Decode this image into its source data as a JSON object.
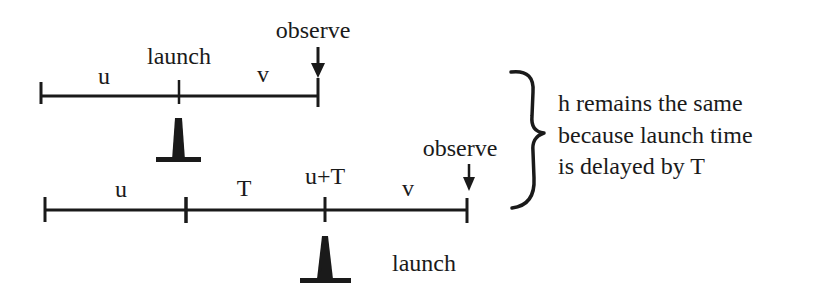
{
  "diagram": {
    "scenario_1": {
      "labels": {
        "segment_before_launch": "u",
        "launch": "launch",
        "segment_after_launch": "v",
        "observe": "observe"
      }
    },
    "scenario_2": {
      "labels": {
        "segment_first": "u",
        "segment_delay": "T",
        "launch_time": "u+T",
        "segment_after_launch": "v",
        "observe": "observe",
        "launch": "launch"
      }
    },
    "explanation": {
      "lines": [
        "h remains the same",
        "because launch time",
        "is delayed by T"
      ]
    },
    "colors": {
      "ink": "#1a1a1a",
      "background": "#ffffff"
    }
  }
}
